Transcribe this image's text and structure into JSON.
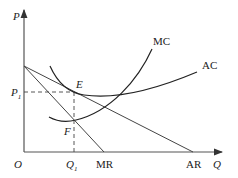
{
  "diagram": {
    "title": "",
    "axes": {
      "y_label": "P",
      "x_label": "Q",
      "origin_label": "O"
    },
    "curves": [
      {
        "name": "MC",
        "label": "MC",
        "type": "u-shaped cost curve"
      },
      {
        "name": "AC",
        "label": "AC",
        "type": "u-shaped cost curve"
      },
      {
        "name": "AR",
        "label": "AR",
        "type": "downward linear demand"
      },
      {
        "name": "MR",
        "label": "MR",
        "type": "downward linear marginal revenue"
      }
    ],
    "points": [
      {
        "name": "E",
        "label": "E",
        "description": "AC tangent / equilibrium price point at Q1"
      },
      {
        "name": "F",
        "label": "F",
        "description": "MC = MR intersection"
      }
    ],
    "price_level": {
      "label": "P",
      "subscript": "1"
    },
    "quantity_level": {
      "label": "Q",
      "subscript": "1"
    },
    "colors": {
      "line": "#333333",
      "background": "#ffffff"
    }
  }
}
